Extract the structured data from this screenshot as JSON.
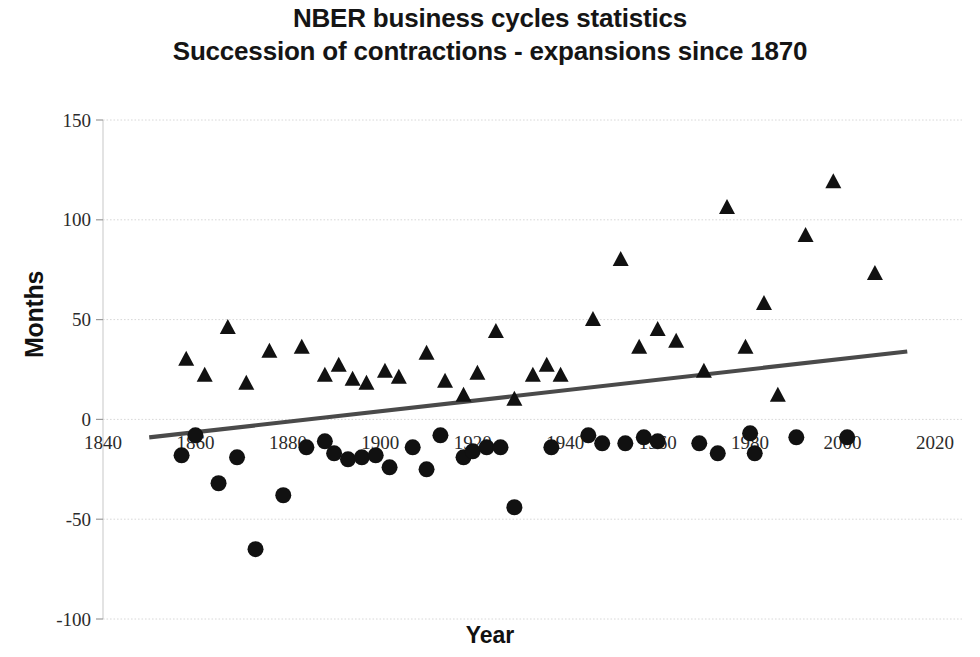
{
  "chart_data": {
    "type": "scatter",
    "title": "NBER business cycles statistics",
    "subtitle": "Succession of contractions - expansions since 1870",
    "xlabel": "Year",
    "ylabel": "Months",
    "xlim": [
      1840,
      2020
    ],
    "ylim": [
      -100,
      150
    ],
    "xticks": [
      1840,
      1860,
      1880,
      1900,
      1920,
      1940,
      1960,
      1980,
      2000,
      2020
    ],
    "yticks": [
      -100,
      -50,
      0,
      50,
      100,
      150
    ],
    "grid": "horizontal",
    "legend": "none",
    "marker_color": "#111111",
    "trendline_color": "#4a4a4a",
    "gridline_color": "#d8d8d8",
    "series": [
      {
        "name": "Expansions",
        "marker": "triangle",
        "points": [
          {
            "x": 1858,
            "y": 30
          },
          {
            "x": 1862,
            "y": 22
          },
          {
            "x": 1867,
            "y": 46
          },
          {
            "x": 1871,
            "y": 18
          },
          {
            "x": 1876,
            "y": 34
          },
          {
            "x": 1883,
            "y": 36
          },
          {
            "x": 1888,
            "y": 22
          },
          {
            "x": 1891,
            "y": 27
          },
          {
            "x": 1894,
            "y": 20
          },
          {
            "x": 1897,
            "y": 18
          },
          {
            "x": 1901,
            "y": 24
          },
          {
            "x": 1904,
            "y": 21
          },
          {
            "x": 1910,
            "y": 33
          },
          {
            "x": 1914,
            "y": 19
          },
          {
            "x": 1918,
            "y": 12
          },
          {
            "x": 1921,
            "y": 23
          },
          {
            "x": 1925,
            "y": 44
          },
          {
            "x": 1929,
            "y": 10
          },
          {
            "x": 1933,
            "y": 22
          },
          {
            "x": 1936,
            "y": 27
          },
          {
            "x": 1939,
            "y": 22
          },
          {
            "x": 1946,
            "y": 50
          },
          {
            "x": 1952,
            "y": 80
          },
          {
            "x": 1956,
            "y": 36
          },
          {
            "x": 1960,
            "y": 45
          },
          {
            "x": 1964,
            "y": 39
          },
          {
            "x": 1970,
            "y": 24
          },
          {
            "x": 1975,
            "y": 106
          },
          {
            "x": 1979,
            "y": 36
          },
          {
            "x": 1983,
            "y": 58
          },
          {
            "x": 1986,
            "y": 12
          },
          {
            "x": 1992,
            "y": 92
          },
          {
            "x": 1998,
            "y": 119
          },
          {
            "x": 2007,
            "y": 73
          }
        ]
      },
      {
        "name": "Contractions",
        "marker": "circle",
        "points": [
          {
            "x": 1857,
            "y": -18
          },
          {
            "x": 1860,
            "y": -8
          },
          {
            "x": 1865,
            "y": -32
          },
          {
            "x": 1869,
            "y": -19
          },
          {
            "x": 1873,
            "y": -65
          },
          {
            "x": 1879,
            "y": -38
          },
          {
            "x": 1884,
            "y": -14
          },
          {
            "x": 1888,
            "y": -11
          },
          {
            "x": 1890,
            "y": -17
          },
          {
            "x": 1893,
            "y": -20
          },
          {
            "x": 1896,
            "y": -19
          },
          {
            "x": 1899,
            "y": -18
          },
          {
            "x": 1902,
            "y": -24
          },
          {
            "x": 1907,
            "y": -14
          },
          {
            "x": 1910,
            "y": -25
          },
          {
            "x": 1913,
            "y": -8
          },
          {
            "x": 1918,
            "y": -19
          },
          {
            "x": 1920,
            "y": -16
          },
          {
            "x": 1923,
            "y": -14
          },
          {
            "x": 1926,
            "y": -14
          },
          {
            "x": 1929,
            "y": -44
          },
          {
            "x": 1937,
            "y": -14
          },
          {
            "x": 1945,
            "y": -8
          },
          {
            "x": 1948,
            "y": -12
          },
          {
            "x": 1953,
            "y": -12
          },
          {
            "x": 1957,
            "y": -9
          },
          {
            "x": 1960,
            "y": -11
          },
          {
            "x": 1969,
            "y": -12
          },
          {
            "x": 1973,
            "y": -17
          },
          {
            "x": 1980,
            "y": -7
          },
          {
            "x": 1981,
            "y": -17
          },
          {
            "x": 1990,
            "y": -9
          },
          {
            "x": 2001,
            "y": -9
          }
        ]
      }
    ],
    "trendline": {
      "x_start": 1850,
      "y_start": -9,
      "x_end": 2014,
      "y_end": 34
    }
  }
}
